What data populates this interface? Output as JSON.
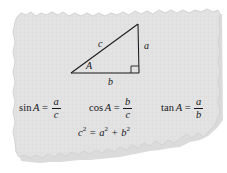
{
  "figure": {
    "kind": "torn-paper-note",
    "paper_color": "#e3e3e3",
    "paper_edge_color": "#cfcfcf",
    "shadow_color": "#b4b4b4",
    "ink_color": "#16161a",
    "background_color": "#ffffff"
  },
  "diagram": {
    "name": "right-triangle",
    "vertices": {
      "angle_a": [
        71,
        73
      ],
      "right_angle": [
        139,
        73
      ],
      "apex": [
        138,
        24
      ]
    },
    "labels": {
      "hypotenuse": "c",
      "opposite": "a",
      "adjacent": "b",
      "angle": "A"
    },
    "right_angle_marker": "square"
  },
  "formulas": {
    "sin": {
      "fn": "sin",
      "arg": "A",
      "eq": "=",
      "numerator": "a",
      "denominator": "c"
    },
    "cos": {
      "fn": "cos",
      "arg": "A",
      "eq": "=",
      "numerator": "b",
      "denominator": "c"
    },
    "tan": {
      "fn": "tan",
      "arg": "A",
      "eq": "=",
      "numerator": "a",
      "denominator": "b"
    },
    "pythagorean": {
      "c": "c",
      "c_exp": "2",
      "eq": "=",
      "a": "a",
      "a_exp": "2",
      "plus": "+",
      "b": "b",
      "b_exp": "2"
    }
  }
}
